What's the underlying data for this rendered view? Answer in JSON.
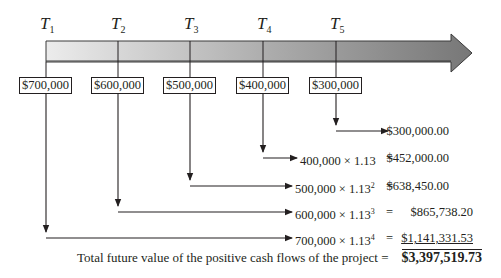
{
  "timeline": {
    "periods": [
      {
        "label": "T",
        "sub": "1",
        "cash_flow": "$700,000"
      },
      {
        "label": "T",
        "sub": "2",
        "cash_flow": "$600,000"
      },
      {
        "label": "T",
        "sub": "3",
        "cash_flow": "$500,000"
      },
      {
        "label": "T",
        "sub": "4",
        "cash_flow": "$400,000"
      },
      {
        "label": "T",
        "sub": "5",
        "cash_flow": "$300,000"
      }
    ],
    "arrow_gradient": [
      "#e6e6e6",
      "#7a7a7a"
    ]
  },
  "calculations": [
    {
      "expr": "",
      "exp": "",
      "eq": "",
      "value": "$300,000.00"
    },
    {
      "expr": "400,000 × 1.13",
      "exp": "",
      "eq": "=",
      "value": "$452,000.00"
    },
    {
      "expr": "500,000 × 1.13",
      "exp": "2",
      "eq": "=",
      "value": "$638,450.00"
    },
    {
      "expr": "600,000 × 1.13",
      "exp": "3",
      "eq": "=",
      "value": "$865,738.20"
    },
    {
      "expr": "700,000 × 1.13",
      "exp": "4",
      "eq": "=",
      "value": "$1,141,331.53"
    }
  ],
  "total": {
    "label": "Total future value of the positive cash flows of the project",
    "eq": "=",
    "value": "$3,397,519.73"
  }
}
